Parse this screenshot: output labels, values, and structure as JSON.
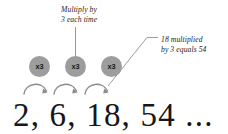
{
  "diagram": {
    "background_color": "#ffffff",
    "circle_fill_color": "#9d9d9d",
    "arrow_color": "#8c8c8c",
    "leader_line_color": "#8a8a8a",
    "text_color": "#1c1c1c"
  },
  "callouts": {
    "top": {
      "line1": "Multiply by",
      "line2": "3 each time"
    },
    "right": {
      "line1": "18 multiplied",
      "line2": "by 3 equals 54"
    }
  },
  "multipliers": [
    {
      "label": "x3"
    },
    {
      "label": "x3"
    },
    {
      "label": "x3"
    }
  ],
  "sequence": {
    "text": "2, 6, 18, 54 ...",
    "terms": [
      2,
      6,
      18,
      54
    ],
    "ratio": 3,
    "ellipsis": "..."
  },
  "arrows": {
    "count": 3,
    "direction": "right"
  }
}
